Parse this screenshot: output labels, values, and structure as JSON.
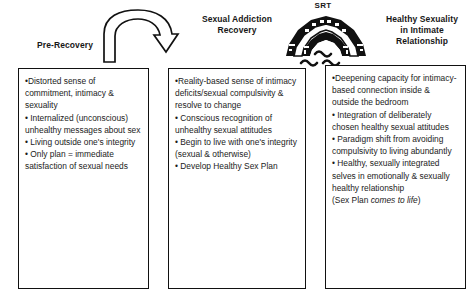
{
  "headers": {
    "pre_recovery": "Pre-Recovery",
    "sexual_addiction_recovery_line1": "Sexual Addiction",
    "sexual_addiction_recovery_line2": "Recovery",
    "healthy_line1": "Healthy Sexuality",
    "healthy_line2": "in Intimate",
    "healthy_line3": "Relationship"
  },
  "bridge": {
    "label": "SRT",
    "icon": "bridge-icon",
    "water_icon": "water-waves-icon"
  },
  "arrow": {
    "icon": "curved-arrow-icon"
  },
  "panels": {
    "pre_recovery": {
      "bullets": [
        "Distorted sense of commitment, intimacy & sexuality",
        "Internalized (unconscious) unhealthy messages about sex",
        "Living outside one's integrity",
        "Only plan = immediate satisfaction of sexual needs"
      ]
    },
    "sexual_addiction_recovery": {
      "bullets": [
        "Reality-based sense of intimacy deficits/sexual compulsivity & resolve to change",
        "Conscious recognition of unhealthy sexual attitudes",
        "Begin to live with one's integrity (sexual & otherwise)",
        "Develop Healthy Sex Plan"
      ]
    },
    "healthy_sexuality": {
      "bullets": [
        "Deepening capacity for intimacy-based connection inside & outside the bedroom",
        "Integration of deliberately chosen healthy sexual attitudes",
        "Paradigm shift from avoiding compulsivity to living abundantly",
        "Healthy, sexually integrated selves in emotionally & sexually healthy relationship"
      ],
      "note_prefix": "(Sex Plan ",
      "note_italic": "comes to life",
      "note_suffix": ")"
    }
  },
  "colors": {
    "ink": "#111111",
    "text": "#1b1b1b",
    "background": "#ffffff"
  }
}
